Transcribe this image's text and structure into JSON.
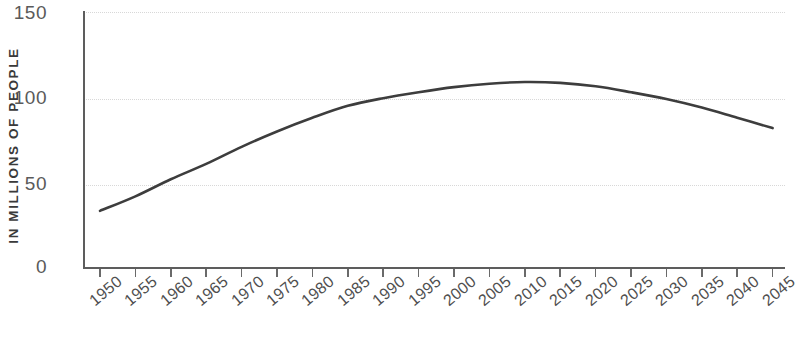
{
  "chart_data": {
    "type": "line",
    "title": "",
    "xlabel": "",
    "ylabel": "IN MILLIONS OF PEOPLE",
    "ylim": [
      0,
      150
    ],
    "yticks": [
      0,
      50,
      100,
      150
    ],
    "ytick_labels": [
      "0",
      "50",
      "100",
      "150"
    ],
    "grid": true,
    "grid_style": "dotted-horizontal",
    "legend": "none",
    "line_color": "#3d3d3d",
    "categories": [
      "1950",
      "1955",
      "1960",
      "1965",
      "1970",
      "1975",
      "1980",
      "1985",
      "1990",
      "1995",
      "2000",
      "2005",
      "2010",
      "2015",
      "2020",
      "2025",
      "2030",
      "2035",
      "2040",
      "2045"
    ],
    "x": [
      1950,
      1955,
      1960,
      1965,
      1970,
      1975,
      1980,
      1985,
      1990,
      1995,
      2000,
      2005,
      2010,
      2015,
      2020,
      2025,
      2030,
      2035,
      2040,
      2045
    ],
    "values": [
      33.5,
      42,
      52,
      61,
      71,
      80,
      88,
      95,
      99.5,
      103,
      106,
      108,
      109,
      108.5,
      106.5,
      103,
      99,
      94,
      88,
      82
    ]
  },
  "axis": {
    "ylabel_text": "IN MILLIONS OF PEOPLE"
  }
}
